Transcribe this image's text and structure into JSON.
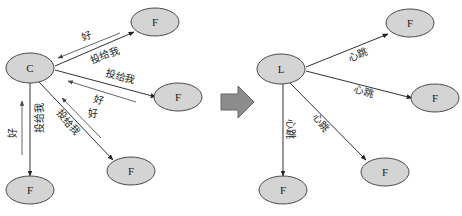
{
  "colors": {
    "node_fill": "#d4d4d4",
    "node_stroke": "#4a4a4a",
    "edge": "#333333",
    "reply_edge": "#555555",
    "transition_arrow": "#8c8c8c"
  },
  "left_diagram": {
    "title": "candidate requesting votes",
    "center_node": {
      "label": "C",
      "cx": 30,
      "cy": 68
    },
    "nodes": [
      {
        "label": "F",
        "cx": 155,
        "cy": 22
      },
      {
        "label": "F",
        "cx": 178,
        "cy": 97
      },
      {
        "label": "F",
        "cx": 131,
        "cy": 171
      },
      {
        "label": "F",
        "cx": 30,
        "cy": 190
      }
    ],
    "request_label": "投给我",
    "reply_label": "好"
  },
  "transition_arrow": {
    "icon": "right-block-arrow-icon"
  },
  "right_diagram": {
    "title": "leader sending heartbeats",
    "center_node": {
      "label": "L",
      "cx": 281,
      "cy": 69
    },
    "nodes": [
      {
        "label": "F",
        "cx": 410,
        "cy": 23
      },
      {
        "label": "F",
        "cx": 435,
        "cy": 98
      },
      {
        "label": "F",
        "cx": 385,
        "cy": 172
      },
      {
        "label": "F",
        "cx": 283,
        "cy": 190
      }
    ],
    "heartbeat_label": "心跳"
  }
}
